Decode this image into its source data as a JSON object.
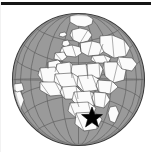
{
  "figure": {
    "title": "World globe locator map",
    "description": "Orthographic projection globe centered on Africa with a star marker in southern Africa",
    "background_color": "#ffffff"
  },
  "top_rule": {
    "name": "horizontal-rule",
    "color": "#151515",
    "x": 0,
    "y": 2,
    "width": 151,
    "height": 3
  },
  "globe": {
    "projection": "orthographic",
    "center_x": 78.5,
    "center_y": 79.5,
    "radius": 66,
    "ocean_color": "#9a9a9a",
    "land_color": "#fbfbfb",
    "border_color": "#3a3a3a",
    "outline_color": "#3c3c3c",
    "graticule_color": "#5e5e5e",
    "graticule_meridians": 12,
    "graticule_parallels": 7
  },
  "marker": {
    "name": "star-marker",
    "shape": "star-5",
    "color": "#000000",
    "x": 92,
    "y": 118,
    "size": 11,
    "region_label": "Southern Africa"
  },
  "landmasses": [
    "Africa",
    "Europe",
    "Middle East",
    "Western Asia",
    "Greenland",
    "Iceland",
    "Madagascar",
    "South America (edge)",
    "Arabian Peninsula"
  ]
}
